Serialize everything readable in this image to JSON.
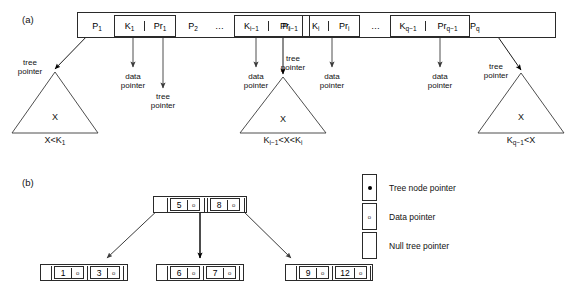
{
  "figure": {
    "panels": [
      {
        "tag": "(a)",
        "description": "Internal node of a B-tree with q tree pointers and q-1 key/data-pointer pairs"
      },
      {
        "tag": "(b)",
        "description": "B-tree of order p = 3 with integer keys"
      }
    ]
  },
  "panel_a": {
    "tag": "(a)",
    "node_slots": [
      {
        "type": "tree-pointer",
        "label": "P",
        "sub": "1"
      },
      {
        "type": "key-pair",
        "key": "K",
        "key_sub": "1",
        "data": "Pr",
        "data_sub": "1"
      },
      {
        "type": "tree-pointer",
        "label": "P",
        "sub": "2"
      },
      {
        "type": "ellipsis",
        "label": "…"
      },
      {
        "type": "key-pair",
        "key": "K",
        "key_sub": "i−1",
        "data": "Pr",
        "data_sub": "i−1"
      },
      {
        "type": "tree-pointer",
        "label": "P",
        "sub": "i"
      },
      {
        "type": "key-pair",
        "key": "K",
        "key_sub": "i",
        "data": "Pr",
        "data_sub": "i"
      },
      {
        "type": "ellipsis",
        "label": "…"
      },
      {
        "type": "key-pair",
        "key": "K",
        "key_sub": "q−1",
        "data": "Pr",
        "data_sub": "q−1"
      },
      {
        "type": "tree-pointer",
        "label": "P",
        "sub": "q"
      }
    ],
    "annotations": [
      {
        "id": "tree-pointer-1",
        "line1": "tree",
        "line2": "pointer"
      },
      {
        "id": "data-pointer-1",
        "line1": "data",
        "line2": "pointer"
      },
      {
        "id": "tree-pointer-2",
        "line1": "tree",
        "line2": "pointer"
      },
      {
        "id": "data-pointer-2",
        "line1": "data",
        "line2": "pointer"
      },
      {
        "id": "tree-pointer-3",
        "line1": "tree",
        "line2": "pointer"
      },
      {
        "id": "data-pointer-3",
        "line1": "data",
        "line2": "pointer"
      },
      {
        "id": "data-pointer-4",
        "line1": "data",
        "line2": "pointer"
      },
      {
        "id": "tree-pointer-4",
        "line1": "tree",
        "line2": "pointer"
      }
    ],
    "subtrees": [
      {
        "id": "subtree-left",
        "inner": "X",
        "caption": "X<K",
        "caption_sub": "1",
        "caption_tail": ""
      },
      {
        "id": "subtree-middle",
        "inner": "X",
        "caption": "K",
        "caption_sub": "i−1",
        "caption_tail": "<X<K",
        "caption_tail_sub": "i"
      },
      {
        "id": "subtree-right",
        "inner": "X",
        "caption": "K",
        "caption_sub": "q−1",
        "caption_tail": "<X"
      }
    ]
  },
  "panel_b": {
    "tag": "(b)",
    "root": {
      "keys": [
        {
          "key": "5",
          "data_pointer": "o"
        },
        {
          "key": "8",
          "data_pointer": "o"
        }
      ],
      "tree_pointers": 3
    },
    "leaves": [
      {
        "id": "leaf-left",
        "keys": [
          {
            "key": "1",
            "data_pointer": "o"
          },
          {
            "key": "3",
            "data_pointer": "o"
          }
        ]
      },
      {
        "id": "leaf-middle",
        "keys": [
          {
            "key": "6",
            "data_pointer": "o"
          },
          {
            "key": "7",
            "data_pointer": "o"
          }
        ]
      },
      {
        "id": "leaf-right",
        "keys": [
          {
            "key": "9",
            "data_pointer": "o"
          },
          {
            "key": "12",
            "data_pointer": "o"
          }
        ]
      }
    ],
    "legend": [
      {
        "id": "tree-node-pointer",
        "glyph": "dot",
        "label": "Tree node pointer"
      },
      {
        "id": "data-pointer",
        "glyph": "zero",
        "label": "Data pointer"
      },
      {
        "id": "null-tree-pointer",
        "glyph": "none",
        "label": "Null tree pointer"
      }
    ]
  },
  "colors": {
    "stroke": "#2a2a2a",
    "arrow_dark": "#000000",
    "arrow_gray": "#444444",
    "text": "#111111",
    "background": "#ffffff"
  }
}
